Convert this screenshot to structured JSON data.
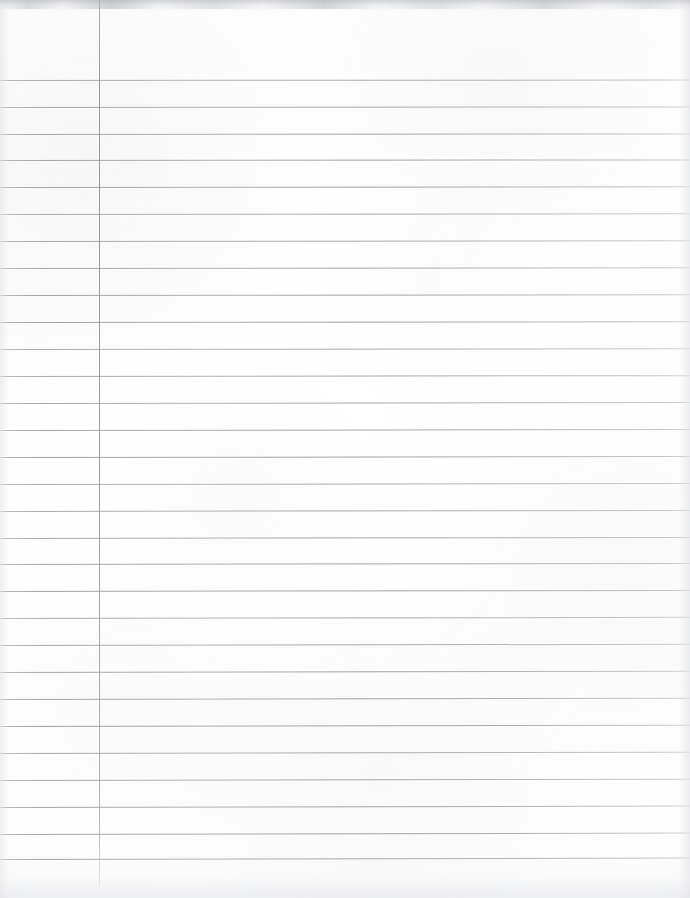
{
  "document": {
    "kind": "scanned-lined-notebook-paper",
    "title": "Blank lined notebook page",
    "content_text": "",
    "page_width": 690,
    "page_height": 898,
    "orientation": "portrait",
    "background_color": "#fdfdfd"
  },
  "ruling": {
    "line_color": "#999ba2",
    "line_thickness_px": 1,
    "line_count": 30,
    "first_line_y": 80,
    "line_spacing_px": 26.9,
    "line_skew_deg": -0.12,
    "lines_y": [
      80,
      107,
      134,
      160,
      187,
      214,
      241,
      268,
      295,
      322,
      349,
      376,
      403,
      430,
      457,
      484,
      511,
      538,
      564,
      591,
      618,
      645,
      672,
      699,
      726,
      753,
      780,
      807,
      834,
      859
    ]
  },
  "margin": {
    "label": "left margin rule",
    "color": "#92949b",
    "x": 99,
    "top_y": 0,
    "bottom_y": 886,
    "thickness_px": 1
  },
  "scan_artifacts": {
    "top_edge_shadow": true,
    "bottom_edge_shadow": true,
    "left_edge_shadow": true,
    "right_edge_shadow": true,
    "paper_grain": true
  }
}
